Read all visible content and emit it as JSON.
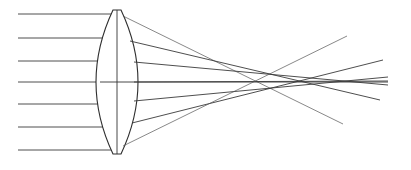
{
  "diagram": {
    "title": "",
    "type": "lens-ray-diagram",
    "colors": {
      "line": "#3a3a3a",
      "background": "#ffffff"
    },
    "lens": {
      "center_x": 117,
      "top_y": 10,
      "bottom_y": 154,
      "half_width_flat": 4,
      "bulge": 17
    },
    "incoming_rays": [
      {
        "y": 14,
        "x_start": 18,
        "x_end": 113
      },
      {
        "y": 38,
        "x_start": 18,
        "x_end": 107
      },
      {
        "y": 61,
        "x_start": 18,
        "x_end": 102
      },
      {
        "y": 82,
        "x_start": 18,
        "x_end": 100
      },
      {
        "y": 104,
        "x_start": 18,
        "x_end": 102
      },
      {
        "y": 127,
        "x_start": 18,
        "x_end": 107
      },
      {
        "y": 150,
        "x_start": 18,
        "x_end": 113
      }
    ],
    "outgoing_rays": [
      {
        "x1": 123,
        "y1": 16,
        "x2": 343,
        "y2": 124
      },
      {
        "x1": 130,
        "y1": 41,
        "x2": 380,
        "y2": 100
      },
      {
        "x1": 134,
        "y1": 62,
        "x2": 388,
        "y2": 85
      },
      {
        "x1": 134,
        "y1": 82,
        "x2": 388,
        "y2": 81
      },
      {
        "x1": 134,
        "y1": 101,
        "x2": 388,
        "y2": 77
      },
      {
        "x1": 132,
        "y1": 123,
        "x2": 383,
        "y2": 60
      },
      {
        "x1": 123,
        "y1": 146,
        "x2": 347,
        "y2": 36
      }
    ],
    "optical_axis": {
      "x1": 100,
      "y1": 82,
      "x2": 388,
      "y2": 82
    }
  }
}
